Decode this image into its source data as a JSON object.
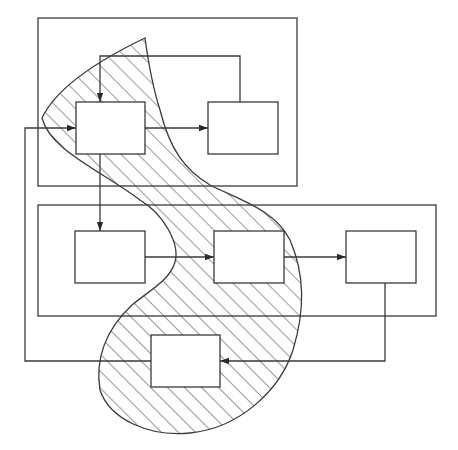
{
  "diagram": {
    "title": "",
    "type": "block-diagram-with-hatched-region",
    "colors": {
      "stroke": "#3a3a3a",
      "background": "#ffffff",
      "hatch": "#3a3a3a",
      "box_fill": "#ffffff"
    },
    "containers": [
      {
        "id": "top-group",
        "x": 38,
        "y": 18,
        "w": 259,
        "h": 168
      },
      {
        "id": "bottom-group",
        "x": 38,
        "y": 205,
        "w": 398,
        "h": 111
      }
    ],
    "boxes": [
      {
        "id": "A",
        "label": "",
        "x": 76,
        "y": 102,
        "w": 69,
        "h": 52
      },
      {
        "id": "B",
        "label": "",
        "x": 208,
        "y": 102,
        "w": 70,
        "h": 52
      },
      {
        "id": "C",
        "label": "",
        "x": 75,
        "y": 231,
        "w": 70,
        "h": 52
      },
      {
        "id": "D",
        "label": "",
        "x": 214,
        "y": 231,
        "w": 70,
        "h": 52
      },
      {
        "id": "E",
        "label": "",
        "x": 346,
        "y": 231,
        "w": 70,
        "h": 52
      },
      {
        "id": "F",
        "label": "",
        "x": 151,
        "y": 335,
        "w": 69,
        "h": 52
      }
    ],
    "edges": [
      {
        "from": "A",
        "to": "B",
        "points": [
          [
            145,
            128
          ],
          [
            208,
            128
          ]
        ],
        "arrow": true
      },
      {
        "from": "B",
        "to": "A",
        "points": [
          [
            240,
            102
          ],
          [
            240,
            56
          ],
          [
            100,
            56
          ],
          [
            100,
            102
          ]
        ],
        "arrow": true
      },
      {
        "from": "A",
        "to": "C",
        "points": [
          [
            100,
            154
          ],
          [
            100,
            231
          ]
        ],
        "arrow": true
      },
      {
        "from": "C",
        "to": "D",
        "points": [
          [
            145,
            257
          ],
          [
            214,
            257
          ]
        ],
        "arrow": true
      },
      {
        "from": "D",
        "to": "E",
        "points": [
          [
            284,
            257
          ],
          [
            346,
            257
          ]
        ],
        "arrow": true
      },
      {
        "from": "E",
        "to": "F",
        "points": [
          [
            385,
            283
          ],
          [
            385,
            361
          ],
          [
            220,
            361
          ]
        ],
        "arrow": true
      },
      {
        "from": "F",
        "to": "A",
        "points": [
          [
            151,
            361
          ],
          [
            25,
            361
          ],
          [
            25,
            128
          ],
          [
            76,
            128
          ]
        ],
        "arrow": true
      }
    ],
    "region": {
      "id": "hatched-region",
      "pattern": "diagonal-hatch",
      "shape": "s-curve blob enclosing A, D, F"
    }
  }
}
